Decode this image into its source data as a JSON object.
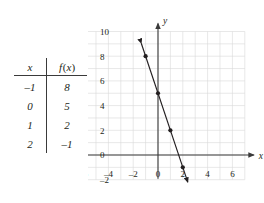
{
  "table": {
    "headers": [
      "x",
      "f(x)"
    ],
    "rows": [
      {
        "x": "–1",
        "fx": "8"
      },
      {
        "x": "0",
        "fx": "5"
      },
      {
        "x": "1",
        "fx": "2"
      },
      {
        "x": "2",
        "fx": "–1"
      }
    ]
  },
  "chart_data": {
    "type": "line",
    "title": "",
    "xlabel": "x",
    "ylabel": "y",
    "xlim": [
      -7,
      7
    ],
    "ylim": [
      -2,
      10
    ],
    "xticks": [
      "–6",
      "–4",
      "–2",
      "0",
      "2",
      "4",
      "6"
    ],
    "xtick_values": [
      -6,
      -4,
      -2,
      0,
      2,
      4,
      6
    ],
    "yticks": [
      "10",
      "8",
      "6",
      "4",
      "2",
      "0",
      "–2"
    ],
    "ytick_values": [
      10,
      8,
      6,
      4,
      2,
      0,
      -2
    ],
    "grid": true,
    "grid_color": "#d8d8d8",
    "axis_color": "#3a3a3a",
    "line_color": "#231f20",
    "point_color": "#231f20",
    "legend": "none",
    "series": [
      {
        "name": "f(x) = -3x + 5",
        "slope": -3,
        "intercept": 5,
        "x": [
          -1,
          0,
          1,
          2
        ],
        "values": [
          8,
          5,
          2,
          -1
        ],
        "line_extent_x": [
          -1.35,
          2.4
        ],
        "arrows": [
          "start",
          "end"
        ]
      }
    ],
    "points": [
      {
        "x": -1,
        "y": 8
      },
      {
        "x": 0,
        "y": 5
      },
      {
        "x": 1,
        "y": 2
      },
      {
        "x": 2,
        "y": -1
      }
    ]
  }
}
